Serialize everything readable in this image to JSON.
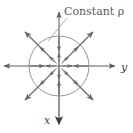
{
  "figure": {
    "title_label": "Constant ρ",
    "background_color": "#ffffff",
    "axis_color": "#5e5e5e",
    "arrow_color": "#6b6b6b",
    "circle_color": "#8a8a8a",
    "label_color": "#5a5a5a",
    "leader_color": "#9a9a9a"
  },
  "axes": {
    "horizontal": {
      "label": "y",
      "label_x": 121,
      "label_y": 71,
      "y_position": 66,
      "x_start": 3,
      "x_end": 116
    },
    "vertical": {
      "label": "x",
      "label_x": 45,
      "label_y": 124,
      "x_position": 59,
      "y_start": 11,
      "y_end": 126
    }
  },
  "circle": {
    "center_x": 59,
    "center_y": 66,
    "radius": 30,
    "meaning": "constant rho"
  },
  "annotation": {
    "text": "Constant ρ",
    "text_x": 64,
    "text_y": 15,
    "font_size": 11,
    "leader": {
      "x1": 67,
      "y1": 18,
      "x2": 48,
      "y2": 41
    }
  },
  "vectors": {
    "inner_radial_count": 8,
    "inner_radius_start": 4,
    "inner_radius_end": 14,
    "outer_radius_start": 20,
    "outer_radius_end": 46,
    "inward_axis_arrows": 4,
    "angles_deg": [
      0,
      45,
      90,
      135,
      180,
      225,
      270,
      315
    ],
    "note": "unit vectors in the rho direction point radially outward"
  }
}
